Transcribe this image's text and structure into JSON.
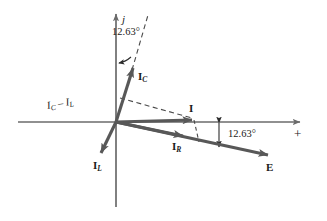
{
  "figure": {
    "background_color": "#ffffff",
    "axis_color": "#6b6b6b",
    "vector_color": "#585858",
    "dashed_color": "#4a4a4a",
    "text_color": "#1a1a1a",
    "width": 327,
    "height": 221
  },
  "axes": {
    "imaginary_label": "j",
    "positive_real_label": "+",
    "origin": {
      "x": 116,
      "y": 122
    }
  },
  "angles": [
    {
      "id": "angle-top",
      "value": "12.63°",
      "between": "j-axis and I_C"
    },
    {
      "id": "angle-right",
      "value": "12.63°",
      "between": "real axis and E"
    }
  ],
  "vectors": [
    {
      "id": "ic",
      "label": "I",
      "subscript": "C",
      "direction": "up-right",
      "tip": {
        "x": 135,
        "y": 62
      }
    },
    {
      "id": "il",
      "label": "I",
      "subscript": "L",
      "direction": "down-left",
      "tip": {
        "x": 100,
        "y": 156
      }
    },
    {
      "id": "ir",
      "label": "I",
      "subscript": "R",
      "direction": "down-right",
      "tip": {
        "x": 186,
        "y": 137
      }
    },
    {
      "id": "i",
      "label": "I",
      "subscript": "",
      "direction": "right",
      "tip": {
        "x": 196,
        "y": 120
      }
    },
    {
      "id": "e",
      "label": "E",
      "subscript": "",
      "direction": "down-right",
      "tip": {
        "x": 272,
        "y": 157
      }
    }
  ],
  "annotations": [
    {
      "id": "ic-minus-il",
      "text_parts": [
        "I",
        "C",
        " − ",
        "I",
        "L"
      ],
      "plain": "I_C − I_L"
    }
  ],
  "labels": {
    "j": "j",
    "plus": "+",
    "ic_main": "I",
    "ic_sub": "C",
    "il_main": "I",
    "il_sub": "L",
    "ir_main": "I",
    "ir_sub": "R",
    "i_main": "I",
    "e_main": "E",
    "angle_top": "12.63°",
    "angle_right": "12.63°",
    "diff_i": "I",
    "diff_c": "C",
    "diff_dash": " – ",
    "diff_i2": "I",
    "diff_l": "L"
  }
}
